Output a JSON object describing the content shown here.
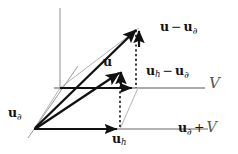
{
  "figure": {
    "type": "vector-space-diagram",
    "background_color": "#ffffff",
    "ink_color": "#111111",
    "axis_color": "#8a8a8a",
    "guide_color": "#b0b0b0",
    "labels": {
      "u_minus_ubnd": {
        "vec": "u",
        "op": "−",
        "vec2": "u",
        "sub2": "∂",
        "x": 160,
        "y": 22
      },
      "u": {
        "vec": "u",
        "x": 103,
        "y": 57
      },
      "uh_minus_ubnd": {
        "vec": "u",
        "sub": "h",
        "op": "−",
        "vec2": "u",
        "sub2": "∂",
        "x": 146,
        "y": 66
      },
      "ubnd": {
        "vec": "u",
        "sub": "∂",
        "x": 8,
        "y": 108
      },
      "uh": {
        "vec": "u",
        "sub": "h",
        "x": 112,
        "y": 134
      },
      "v_space": {
        "text": "𝒱",
        "plain": "V",
        "x": 210,
        "y": 78
      },
      "ubnd_plus_v": {
        "vec": "u",
        "sub": "∂",
        "op": "+",
        "text": "V",
        "x": 178,
        "y": 121
      }
    },
    "geometry": {
      "origin": [
        60,
        88
      ],
      "u_boundary_point": [
        34,
        129
      ],
      "u_point": [
        139,
        27
      ],
      "u_arrow_tip": [
        120,
        70
      ],
      "uh_point": [
        120,
        129
      ],
      "uh_minus_ubnd_tip": [
        135,
        88
      ],
      "vertical_axis_top": [
        60,
        8
      ],
      "v_axis_left": [
        54,
        88
      ],
      "v_axis_right": [
        205,
        88
      ],
      "bottom_axis_right": [
        208,
        129
      ]
    }
  }
}
